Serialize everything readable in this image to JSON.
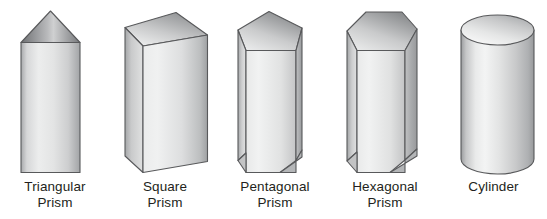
{
  "figure": {
    "background_color": "#ffffff",
    "label_color": "#231f20",
    "outline_color": "#58595b",
    "shapes": [
      {
        "id": "triangular-prism",
        "name": "Triangular Prism",
        "label_line1": "Triangular",
        "label_line2": "Prism",
        "type": "prism",
        "base_sides": 3,
        "top_face_color_light": "#d8d9da",
        "top_face_color_dark": "#7f8184",
        "body_color_light": "#e9eaea",
        "body_color_dark": "#9b9c9e"
      },
      {
        "id": "square-prism",
        "name": "Square Prism",
        "label_line1": "Square",
        "label_line2": "Prism",
        "type": "prism",
        "base_sides": 4,
        "top_face_color_light": "#dcdddd",
        "top_face_color_dark": "#838587",
        "body_color_light": "#ebecec",
        "body_color_dark": "#9a9c9e"
      },
      {
        "id": "pentagonal-prism",
        "name": "Pentagonal Prism",
        "label_line1": "Pentagonal",
        "label_line2": "Prism",
        "type": "prism",
        "base_sides": 5,
        "top_face_color_light": "#dcdddd",
        "top_face_color_dark": "#838587",
        "body_color_light": "#ebecec",
        "body_color_dark": "#9a9c9e"
      },
      {
        "id": "hexagonal-prism",
        "name": "Hexagonal Prism",
        "label_line1": "Hexagonal",
        "label_line2": "Prism",
        "type": "prism",
        "base_sides": 6,
        "top_face_color_light": "#dcdddd",
        "top_face_color_dark": "#838587",
        "body_color_light": "#ebecec",
        "body_color_dark": "#9a9c9e"
      },
      {
        "id": "cylinder",
        "name": "Cylinder",
        "label_line1": "Cylinder",
        "label_line2": "",
        "type": "cylinder",
        "base_sides": 0,
        "top_face_color_light": "#e4e5e5",
        "top_face_color_dark": "#a9abad",
        "body_color_light": "#f0f1f1",
        "body_color_dark": "#939597"
      }
    ]
  }
}
